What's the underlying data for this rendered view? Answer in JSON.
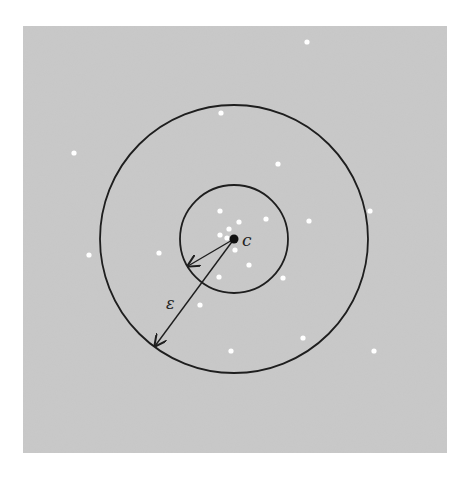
{
  "figure": {
    "background_color": "#c9c9c9",
    "panel": {
      "x": 23,
      "y": 26,
      "width": 424,
      "height": 427
    },
    "center": {
      "x": 234,
      "y": 239,
      "label": "c"
    },
    "inner_circle": {
      "cx": 234,
      "cy": 239,
      "r": 54
    },
    "outer_circle": {
      "cx": 234,
      "cy": 239,
      "r": 134
    },
    "short_arrow": {
      "x1": 234,
      "y1": 239,
      "x2": 188,
      "y2": 266
    },
    "long_arrow": {
      "x1": 234,
      "y1": 239,
      "x2": 155,
      "y2": 346
    },
    "epsilon_label": {
      "text": "ε",
      "x": 166,
      "y": 309
    },
    "points": [
      {
        "x": 307,
        "y": 42
      },
      {
        "x": 221,
        "y": 113
      },
      {
        "x": 74,
        "y": 153
      },
      {
        "x": 278,
        "y": 164
      },
      {
        "x": 370,
        "y": 211
      },
      {
        "x": 220,
        "y": 211
      },
      {
        "x": 266,
        "y": 219
      },
      {
        "x": 239,
        "y": 222
      },
      {
        "x": 309,
        "y": 221
      },
      {
        "x": 229,
        "y": 229
      },
      {
        "x": 220,
        "y": 235
      },
      {
        "x": 227,
        "y": 238
      },
      {
        "x": 235,
        "y": 250
      },
      {
        "x": 159,
        "y": 253
      },
      {
        "x": 89,
        "y": 255
      },
      {
        "x": 249,
        "y": 265
      },
      {
        "x": 219,
        "y": 277
      },
      {
        "x": 283,
        "y": 278
      },
      {
        "x": 200,
        "y": 305
      },
      {
        "x": 303,
        "y": 338
      },
      {
        "x": 231,
        "y": 351
      },
      {
        "x": 374,
        "y": 351
      }
    ]
  }
}
